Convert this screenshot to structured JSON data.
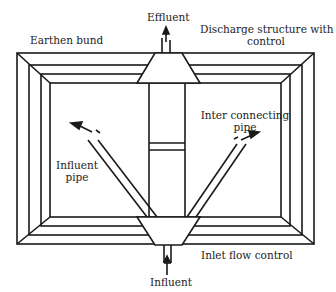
{
  "diagram": {
    "type": "pond-schematic",
    "stroke_color": "#1a1a1a",
    "background": "#ffffff",
    "labels": {
      "effluent": "Effluent",
      "earthen_bund": "Earthen bund",
      "discharge_line1": "Discharge structure with",
      "discharge_line2": "control",
      "inter_line1": "Inter connecting",
      "inter_line2": "pipe",
      "influent_pipe_line1": "Influent",
      "influent_pipe_line2": "pipe",
      "inlet_flow_control": "Inlet flow control",
      "influent": "Influent"
    },
    "components": [
      "earthen-bund",
      "discharge-structure",
      "effluent-outlet",
      "inter-connecting-pipe",
      "influent-pipe",
      "inlet-flow-control",
      "influent-inlet"
    ]
  }
}
